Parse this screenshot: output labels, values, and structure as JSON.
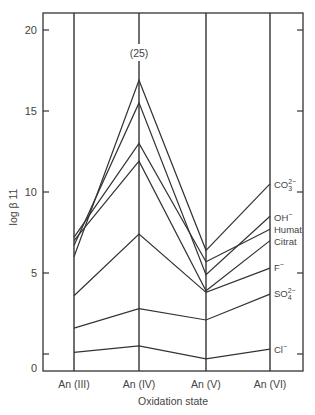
{
  "chart_data": {
    "type": "line",
    "title": "",
    "xlabel": "Oxidation state",
    "ylabel": "log β 11",
    "categories": [
      "An (III)",
      "An (IV)",
      "An (V)",
      "An (VI)"
    ],
    "ylim": [
      -1,
      21
    ],
    "yticks": [
      0,
      5,
      10,
      15,
      20
    ],
    "grid": false,
    "annotation": "(25)",
    "series": [
      {
        "name": "CO3^2-",
        "label_main": "CO",
        "label_sub": "3",
        "label_sup": "2−",
        "values": [
          6.0,
          16.9,
          6.4,
          10.5
        ]
      },
      {
        "name": "OH^-",
        "label_main": "OH",
        "label_sub": "",
        "label_sup": "−",
        "values": [
          6.7,
          15.5,
          4.9,
          8.5
        ]
      },
      {
        "name": "Humat",
        "label_main": "Humat",
        "label_sub": "",
        "label_sup": "",
        "values": [
          7.2,
          13.0,
          5.7,
          7.7
        ]
      },
      {
        "name": "Citrat",
        "label_main": "Citrat",
        "label_sub": "",
        "label_sup": "",
        "values": [
          7.0,
          11.9,
          3.9,
          7.0
        ]
      },
      {
        "name": "F^-",
        "label_main": "F",
        "label_sub": "",
        "label_sup": "−",
        "values": [
          3.6,
          7.4,
          3.8,
          5.3
        ]
      },
      {
        "name": "SO4^2-",
        "label_main": "SO",
        "label_sub": "4",
        "label_sup": "2−",
        "values": [
          1.6,
          2.8,
          2.1,
          3.7
        ]
      },
      {
        "name": "Cl^-",
        "label_main": "Cl",
        "label_sub": "",
        "label_sup": "−",
        "values": [
          0.1,
          0.5,
          -0.3,
          0.3
        ]
      }
    ],
    "legend_position": "inline-right"
  },
  "colors": {
    "line": "#333333",
    "text": "#444444"
  }
}
